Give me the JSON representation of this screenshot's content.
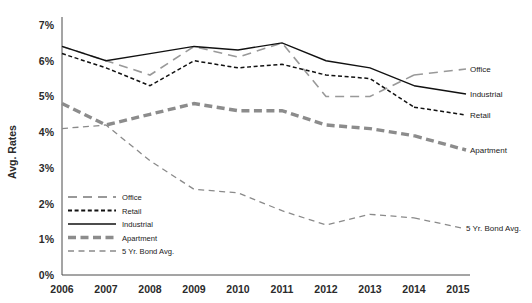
{
  "chart_data": {
    "type": "line",
    "title": "",
    "xlabel": "",
    "ylabel": "Avg. Rates",
    "x": [
      2006,
      2007,
      2008,
      2009,
      2010,
      2011,
      2012,
      2013,
      2014
    ],
    "x_ticks": [
      "2006",
      "2007",
      "2008",
      "2009",
      "2010",
      "2011",
      "2012",
      "2013",
      "2014",
      "2015"
    ],
    "y_ticks": [
      "0%",
      "1%",
      "2%",
      "3%",
      "4%",
      "5%",
      "6%",
      "7%"
    ],
    "ylim": [
      0,
      7
    ],
    "xlim": [
      2006,
      2015
    ],
    "grid": false,
    "legend_position": "inside-lower-left",
    "series": [
      {
        "name": "Office",
        "values": [
          6.4,
          6.0,
          5.6,
          6.4,
          6.1,
          6.5,
          5.0,
          5.0,
          5.6
        ],
        "color": "#999999",
        "style": "long-dash",
        "width": 1.6,
        "end_label": "Office"
      },
      {
        "name": "Retail",
        "values": [
          6.2,
          5.8,
          5.3,
          6.0,
          5.8,
          5.9,
          5.6,
          5.5,
          4.7
        ],
        "color": "#111111",
        "style": "short-dash",
        "width": 1.5,
        "end_label": "Retail"
      },
      {
        "name": "Industrial",
        "values": [
          6.4,
          6.0,
          6.2,
          6.4,
          6.3,
          6.5,
          6.0,
          5.8,
          5.3
        ],
        "color": "#111111",
        "style": "solid",
        "width": 1.4,
        "end_label": "Industrial"
      },
      {
        "name": "Apartment",
        "values": [
          4.8,
          4.2,
          4.5,
          4.8,
          4.6,
          4.6,
          4.2,
          4.1,
          3.9
        ],
        "color": "#8c8c8c",
        "style": "thick-dash",
        "width": 3.4,
        "end_label": "Apartment"
      },
      {
        "name": "5 Yr. Bond Avg.",
        "values": [
          4.1,
          4.2,
          3.2,
          2.4,
          2.3,
          1.8,
          1.4,
          1.7,
          1.6
        ],
        "color": "#8a8a8a",
        "style": "med-dash",
        "width": 1.3,
        "end_label": "5 Yr. Bond Avg."
      }
    ],
    "legend": [
      {
        "label": "Office",
        "style": "long-dash",
        "color": "#999999",
        "width": 2
      },
      {
        "label": "Retail",
        "style": "short-dash",
        "color": "#111111",
        "width": 2
      },
      {
        "label": "Industrial",
        "style": "solid",
        "color": "#111111",
        "width": 1.6
      },
      {
        "label": "Apartment",
        "style": "thick-dash",
        "color": "#8c8c8c",
        "width": 3.4
      },
      {
        "label": "5 Yr. Bond Avg.",
        "style": "med-dash",
        "color": "#8a8a8a",
        "width": 1.3
      }
    ]
  }
}
